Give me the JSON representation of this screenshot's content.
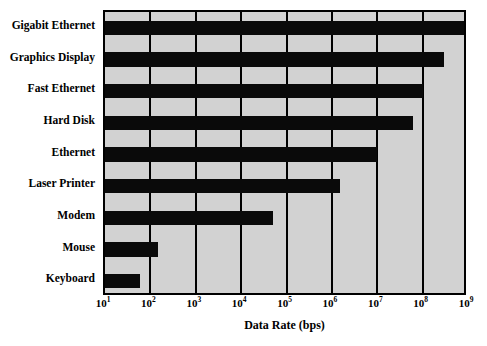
{
  "chart_data": {
    "type": "bar",
    "orientation": "horizontal",
    "title": "",
    "xlabel": "Data Rate (bps)",
    "ylabel": "",
    "xscale": "log",
    "xlim": [
      10,
      1000000000
    ],
    "grid": true,
    "legend": null,
    "xtick_labels": [
      "10¹",
      "10²",
      "10³",
      "10⁴",
      "10⁵",
      "10⁶",
      "10⁷",
      "10⁸",
      "10⁹"
    ],
    "xtick_values": [
      10,
      100,
      1000,
      10000,
      100000,
      1000000,
      10000000,
      100000000,
      1000000000
    ],
    "categories": [
      "Gigabit Ethernet",
      "Graphics Display",
      "Fast Ethernet",
      "Hard Disk",
      "Ethernet",
      "Laser Printer",
      "Modem",
      "Mouse",
      "Keyboard"
    ],
    "values": [
      1000000000,
      300000000,
      100000000,
      60000000,
      10000000,
      1500000,
      50000,
      150,
      60
    ],
    "bar_color": "#0a0a0a",
    "plot_background": "#d2d2d2",
    "axis_color": "#000000"
  },
  "axis": {
    "x_title": "Data Rate (bps)",
    "ticks": [
      {
        "mantissa": "10",
        "exp": "1"
      },
      {
        "mantissa": "10",
        "exp": "2"
      },
      {
        "mantissa": "10",
        "exp": "3"
      },
      {
        "mantissa": "10",
        "exp": "4"
      },
      {
        "mantissa": "10",
        "exp": "5"
      },
      {
        "mantissa": "10",
        "exp": "6"
      },
      {
        "mantissa": "10",
        "exp": "7"
      },
      {
        "mantissa": "10",
        "exp": "8"
      },
      {
        "mantissa": "10",
        "exp": "9"
      }
    ]
  }
}
